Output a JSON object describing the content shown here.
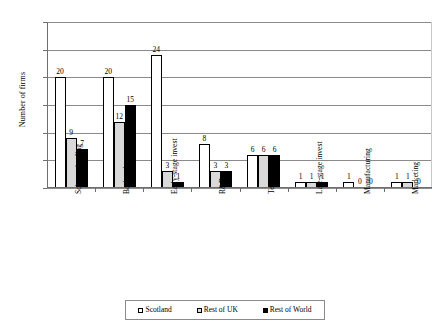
{
  "chart_data": {
    "type": "bar",
    "title": "",
    "xlabel": "",
    "ylabel": "Number of firms",
    "ylim": [
      0,
      30
    ],
    "yticks": [
      0,
      5,
      10,
      15,
      20,
      25,
      30
    ],
    "grid": true,
    "legend_position": "bottom",
    "categories": [
      "Science funding",
      "Basic science",
      "Early-stage invest",
      "R&D",
      "Testing",
      "Late-stage invest",
      "Manufacturing",
      "Marketing"
    ],
    "series": [
      {
        "name": "Scotland",
        "color": "#ffffff",
        "values": [
          20,
          20,
          24,
          8,
          6,
          1,
          1,
          1
        ]
      },
      {
        "name": "Rest of UK",
        "color": "#d9d9d9",
        "values": [
          9,
          12,
          3,
          3,
          6,
          1,
          0,
          1
        ]
      },
      {
        "name": "Rest of World",
        "color": "#000000",
        "values": [
          7,
          15,
          1,
          3,
          6,
          1,
          0,
          0
        ]
      }
    ]
  },
  "axis": {
    "y_title": "Number of firms",
    "y_tick_labels": [
      "0",
      "5",
      "10",
      "15",
      "20",
      "25",
      "30"
    ]
  },
  "legend": {
    "items": [
      {
        "label": "Scotland"
      },
      {
        "label": "Rest of UK"
      },
      {
        "label": "Rest of World"
      }
    ]
  }
}
